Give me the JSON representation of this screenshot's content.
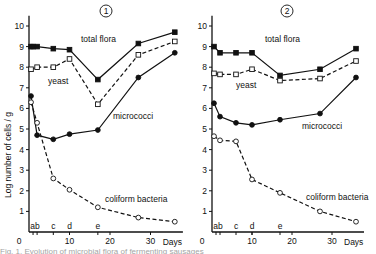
{
  "figure": {
    "ylabel": "Log number of cells / g",
    "xlabel": "Days",
    "caption_partial": "Fig. 1. Evolution of microbial flora of fermenting sausages"
  },
  "chart_data": [
    {
      "type": "line",
      "title": "1",
      "panel_marker": "①",
      "xlabel": "Days",
      "ylabel": "Log number of cells / g",
      "xlim": [
        0,
        38
      ],
      "ylim": [
        0,
        10.5
      ],
      "xticks": [
        0,
        10,
        20,
        30
      ],
      "yticks": [
        1,
        2,
        3,
        4,
        5,
        6,
        7,
        8,
        9,
        10
      ],
      "grid": false,
      "stage_markers": [
        {
          "label": "a",
          "day": 1
        },
        {
          "label": "b",
          "day": 2
        },
        {
          "label": "c",
          "day": 6
        },
        {
          "label": "d",
          "day": 10
        },
        {
          "label": "e",
          "day": 17
        }
      ],
      "series": [
        {
          "name": "total flora",
          "marker": "filled-square",
          "line": "solid",
          "x": [
            0.5,
            1,
            2,
            6,
            10,
            17,
            27,
            36
          ],
          "values": [
            9.0,
            9.0,
            9.0,
            8.9,
            8.85,
            7.4,
            9.15,
            9.7
          ]
        },
        {
          "name": "yeast",
          "marker": "open-square",
          "line": "dashed",
          "x": [
            0.5,
            2,
            6,
            10,
            17,
            27,
            36
          ],
          "values": [
            7.9,
            8.0,
            8.0,
            8.4,
            6.2,
            8.6,
            9.25
          ]
        },
        {
          "name": "micrococci",
          "marker": "filled-circle",
          "line": "solid",
          "x": [
            0.5,
            2,
            6,
            10,
            17,
            27,
            36
          ],
          "values": [
            6.6,
            4.7,
            4.5,
            4.75,
            4.95,
            7.5,
            8.7
          ]
        },
        {
          "name": "coliform bacteria",
          "marker": "open-circle",
          "line": "dashed",
          "x": [
            0.5,
            2,
            6,
            10,
            17,
            27,
            36
          ],
          "values": [
            6.3,
            5.3,
            2.6,
            2.05,
            1.2,
            0.7,
            0.5
          ]
        }
      ],
      "labels": {
        "total_flora": "total flora",
        "yeast": "yeast",
        "micrococci": "micrococci",
        "coliform": "coliform bacteria"
      }
    },
    {
      "type": "line",
      "title": "2",
      "panel_marker": "②",
      "xlabel": "Days",
      "ylabel": "Log number of cells / g",
      "xlim": [
        0,
        38
      ],
      "ylim": [
        0,
        10.5
      ],
      "xticks": [
        0,
        10,
        20,
        30
      ],
      "yticks": [
        1,
        2,
        3,
        4,
        5,
        6,
        7,
        8,
        9,
        10
      ],
      "grid": false,
      "stage_markers": [
        {
          "label": "a",
          "day": 1
        },
        {
          "label": "b",
          "day": 2
        },
        {
          "label": "c",
          "day": 6
        },
        {
          "label": "d",
          "day": 10
        },
        {
          "label": "e",
          "day": 17
        }
      ],
      "series": [
        {
          "name": "total flora",
          "marker": "filled-square",
          "line": "solid",
          "x": [
            0.5,
            2,
            6,
            10,
            17,
            27,
            36
          ],
          "values": [
            9.0,
            8.7,
            8.7,
            8.7,
            7.6,
            7.9,
            8.9
          ]
        },
        {
          "name": "yeast",
          "marker": "open-square",
          "line": "dashed",
          "x": [
            0.5,
            2,
            6,
            10,
            17,
            27,
            36
          ],
          "values": [
            7.7,
            7.65,
            7.65,
            7.9,
            7.35,
            7.45,
            8.3
          ]
        },
        {
          "name": "micrococci",
          "marker": "filled-circle",
          "line": "solid",
          "x": [
            0.5,
            2,
            6,
            10,
            17,
            27,
            36
          ],
          "values": [
            6.25,
            5.6,
            5.3,
            5.2,
            5.45,
            5.75,
            7.5
          ]
        },
        {
          "name": "coliform bacteria",
          "marker": "open-circle",
          "line": "dashed",
          "x": [
            0.5,
            2,
            6,
            10,
            17,
            27,
            36
          ],
          "values": [
            4.65,
            4.45,
            4.4,
            2.55,
            1.9,
            1.0,
            0.5
          ]
        }
      ],
      "labels": {
        "total_flora": "total flora",
        "yeast": "yeast",
        "micrococci": "micrococci",
        "coliform": "coliform bacteria"
      }
    }
  ],
  "layout": {
    "panels": [
      {
        "x0": 29,
        "y0": 232,
        "px_per_day": 4.05,
        "px_per_log": 20.6,
        "title_x": 106,
        "title_y": 14,
        "label_pos": {
          "total_flora": [
            81,
            42
          ],
          "yeast": [
            48,
            84
          ],
          "micrococci": [
            113,
            119
          ],
          "coliform": [
            105,
            202
          ]
        }
      },
      {
        "x0": 212,
        "y0": 232,
        "px_per_day": 4.0,
        "px_per_log": 20.6,
        "title_x": 287,
        "title_y": 14,
        "label_pos": {
          "total_flora": [
            265,
            42
          ],
          "yeast": [
            236,
            88
          ],
          "micrococci": [
            302,
            129
          ],
          "coliform": [
            306,
            200
          ]
        }
      }
    ]
  }
}
